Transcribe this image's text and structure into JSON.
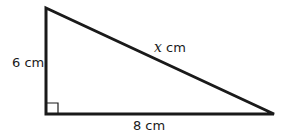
{
  "figure": {
    "type": "right-triangle",
    "stroke_color": "#1a1a1a",
    "stroke_width": 3,
    "vertices": {
      "top": [
        46,
        8
      ],
      "right_angle": [
        46,
        114
      ],
      "right": [
        274,
        114
      ]
    },
    "right_angle_marker": true
  },
  "labels": {
    "vertical_side": {
      "value": "6",
      "unit": "cm",
      "text": "6 cm"
    },
    "horizontal_side": {
      "value": "8",
      "unit": "cm",
      "text": "8 cm"
    },
    "hypotenuse": {
      "variable": "x",
      "unit": " cm"
    }
  }
}
